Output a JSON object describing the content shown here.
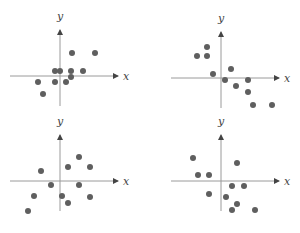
{
  "chart_data": [
    {
      "type": "scatter",
      "panel": "top-left",
      "title": "",
      "xlabel": "x",
      "ylabel": "y",
      "grid": false,
      "origin_px": [
        60,
        76
      ],
      "points_px": [
        [
          72,
          53
        ],
        [
          95,
          53
        ],
        [
          55,
          71
        ],
        [
          60,
          71
        ],
        [
          71,
          71
        ],
        [
          83,
          71
        ],
        [
          71,
          77
        ],
        [
          38,
          82
        ],
        [
          55,
          82
        ],
        [
          66,
          82
        ],
        [
          43,
          94
        ]
      ],
      "correlation": "positive"
    },
    {
      "type": "scatter",
      "panel": "top-right",
      "title": "",
      "xlabel": "x",
      "ylabel": "y",
      "grid": false,
      "origin_px": [
        221,
        78
      ],
      "points_px": [
        [
          207,
          47
        ],
        [
          197,
          56
        ],
        [
          207,
          56
        ],
        [
          213,
          74
        ],
        [
          231,
          69
        ],
        [
          225,
          80
        ],
        [
          248,
          80
        ],
        [
          236,
          86
        ],
        [
          248,
          92
        ],
        [
          253,
          105
        ],
        [
          272,
          105
        ]
      ],
      "correlation": "negative"
    },
    {
      "type": "scatter",
      "panel": "bottom-left",
      "title": "",
      "xlabel": "x",
      "ylabel": "y",
      "grid": false,
      "origin_px": [
        60,
        181
      ],
      "points_px": [
        [
          79,
          157
        ],
        [
          68,
          167
        ],
        [
          90,
          167
        ],
        [
          41,
          171
        ],
        [
          51,
          185
        ],
        [
          79,
          185
        ],
        [
          34,
          196
        ],
        [
          62,
          196
        ],
        [
          90,
          197
        ],
        [
          68,
          203
        ],
        [
          28,
          211
        ]
      ],
      "correlation": "weak positive"
    },
    {
      "type": "scatter",
      "panel": "bottom-right",
      "title": "",
      "xlabel": "x",
      "ylabel": "y",
      "grid": false,
      "origin_px": [
        221,
        181
      ],
      "points_px": [
        [
          193,
          158
        ],
        [
          237,
          163
        ],
        [
          198,
          175
        ],
        [
          209,
          175
        ],
        [
          232,
          186
        ],
        [
          244,
          186
        ],
        [
          209,
          194
        ],
        [
          226,
          197
        ],
        [
          237,
          204
        ],
        [
          232,
          210
        ],
        [
          255,
          210
        ]
      ],
      "correlation": "weak negative"
    }
  ],
  "style": {
    "point_color": "#5f5f5f",
    "axis_color": "#9a9a9a",
    "point_radius": 3
  },
  "labels": {
    "x": "x",
    "y": "y"
  }
}
